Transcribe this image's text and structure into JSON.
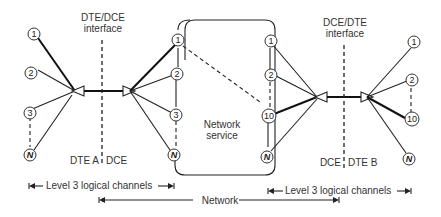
{
  "diagram": {
    "title": "",
    "labels": {
      "left_interface": [
        "DTE/DCE",
        "interface"
      ],
      "right_interface": [
        "DCE/DTE",
        "interface"
      ],
      "network_service": [
        "Network",
        "service"
      ],
      "dte_a": "DTE A",
      "dce_left": "DCE",
      "dce_right": "DCE",
      "dte_b": "DTE B",
      "left_channels": "Level 3 logical channels",
      "right_channels": "Level 3 logical channels",
      "network_span": "Network"
    },
    "nodes": {
      "dte_a": [
        "1",
        "2",
        "3",
        "N"
      ],
      "dce_left": [
        "1",
        "2",
        "3",
        "N"
      ],
      "dce_right": [
        "1",
        "2",
        "10",
        "N"
      ],
      "dte_b": [
        "1",
        "2",
        "10",
        "N"
      ]
    },
    "colors": {
      "line": "#222222",
      "background": "#ffffff",
      "text": "#333333"
    }
  }
}
